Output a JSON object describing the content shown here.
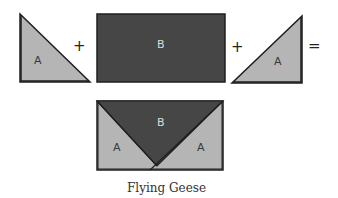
{
  "diagram": {
    "title": "Flying Geese",
    "colors": {
      "piece_a": "#b5b5b5",
      "piece_b": "#464646",
      "outline": "#1e1e1e",
      "label_on_a": "#3a3a3a",
      "label_on_b": "#dcdcdc"
    },
    "equation": {
      "pieces": [
        {
          "id": "left-triangle",
          "label": "A",
          "shape": "right-triangle"
        },
        {
          "id": "rectangle",
          "label": "B",
          "shape": "rectangle"
        },
        {
          "id": "right-triangle",
          "label": "A",
          "shape": "right-triangle"
        }
      ],
      "operators": [
        "+",
        "+",
        "="
      ]
    },
    "result": {
      "name": "Flying Geese",
      "regions": [
        {
          "label": "A",
          "position": "left"
        },
        {
          "label": "B",
          "position": "center-top"
        },
        {
          "label": "A",
          "position": "right"
        }
      ]
    },
    "caption": "Flying Geese"
  }
}
